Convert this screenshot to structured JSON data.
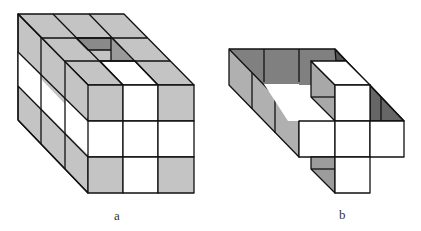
{
  "figures": [
    {
      "id": "a",
      "label": "a",
      "description": "3x3x3 cube block with a hollow column and shaded/white cube faces"
    },
    {
      "id": "b",
      "label": "b",
      "description": "Partial cube frame (ring of cubes) with a cross-shaped front arrangement"
    }
  ],
  "colors": {
    "light_gray": "#c4c4c4",
    "mid_gray": "#a6a6a6",
    "dark_gray": "#7a7a7a",
    "white": "#ffffff",
    "stroke": "#111111"
  }
}
